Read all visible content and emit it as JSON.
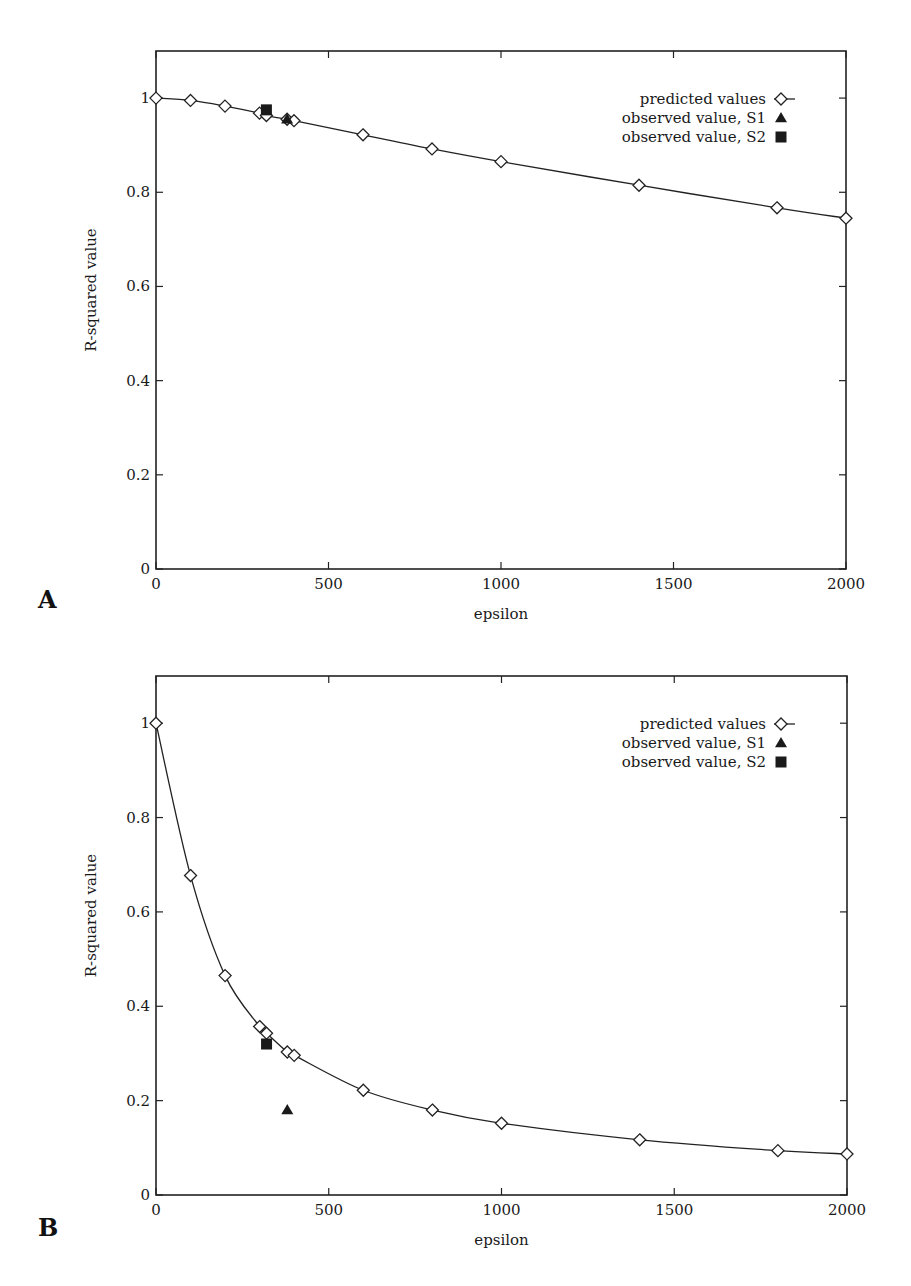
{
  "figure": {
    "panels": [
      {
        "letter": "A",
        "xlabel": "epsilon",
        "ylabel": "R-squared value",
        "legend": [
          "predicted values",
          "observed value, S1",
          "observed value, S2"
        ]
      },
      {
        "letter": "B",
        "xlabel": "epsilon",
        "ylabel": "R-squared value",
        "legend": [
          "predicted values",
          "observed value, S1",
          "observed value, S2"
        ]
      }
    ]
  },
  "chart_data": [
    {
      "type": "line",
      "panel": "A",
      "title": "",
      "xlabel": "epsilon",
      "ylabel": "R-squared value",
      "xlim": [
        0,
        2000
      ],
      "ylim": [
        0,
        1.1
      ],
      "xticks": [
        0,
        500,
        1000,
        1500,
        2000
      ],
      "yticks": [
        0,
        0.2,
        0.4,
        0.6,
        0.8,
        1
      ],
      "ytick_labels": [
        "0",
        "0.2",
        "0.4",
        "0.6",
        "0.8",
        "1"
      ],
      "grid": false,
      "legend_position": "upper right",
      "series": [
        {
          "name": "predicted values",
          "marker": "open-diamond",
          "line": true,
          "x": [
            0,
            100,
            200,
            300,
            320,
            380,
            400,
            600,
            800,
            1000,
            1400,
            1800,
            2000
          ],
          "y": [
            1.0,
            0.995,
            0.983,
            0.968,
            0.963,
            0.955,
            0.952,
            0.922,
            0.892,
            0.865,
            0.815,
            0.767,
            0.745
          ]
        },
        {
          "name": "observed value, S1",
          "marker": "filled-triangle",
          "line": false,
          "x": [
            380
          ],
          "y": [
            0.955
          ]
        },
        {
          "name": "observed value, S2",
          "marker": "filled-square",
          "line": false,
          "x": [
            320
          ],
          "y": [
            0.975
          ]
        }
      ]
    },
    {
      "type": "line",
      "panel": "B",
      "title": "",
      "xlabel": "epsilon",
      "ylabel": "R-squared value",
      "xlim": [
        0,
        2000
      ],
      "ylim": [
        0,
        1.1
      ],
      "xticks": [
        0,
        500,
        1000,
        1500,
        2000
      ],
      "yticks": [
        0,
        0.2,
        0.4,
        0.6,
        0.8,
        1
      ],
      "ytick_labels": [
        "0",
        "0.2",
        "0.4",
        "0.6",
        "0.8",
        "1"
      ],
      "grid": false,
      "legend_position": "upper right",
      "series": [
        {
          "name": "predicted values",
          "marker": "open-diamond",
          "line": true,
          "x": [
            0,
            100,
            200,
            300,
            320,
            380,
            400,
            600,
            800,
            1000,
            1400,
            1800,
            2000
          ],
          "y": [
            1.0,
            0.677,
            0.465,
            0.357,
            0.343,
            0.303,
            0.296,
            0.222,
            0.18,
            0.152,
            0.117,
            0.094,
            0.087
          ]
        },
        {
          "name": "observed value, S1",
          "marker": "filled-triangle",
          "line": false,
          "x": [
            380
          ],
          "y": [
            0.18
          ]
        },
        {
          "name": "observed value, S2",
          "marker": "filled-square",
          "line": false,
          "x": [
            320
          ],
          "y": [
            0.32
          ]
        }
      ]
    }
  ]
}
